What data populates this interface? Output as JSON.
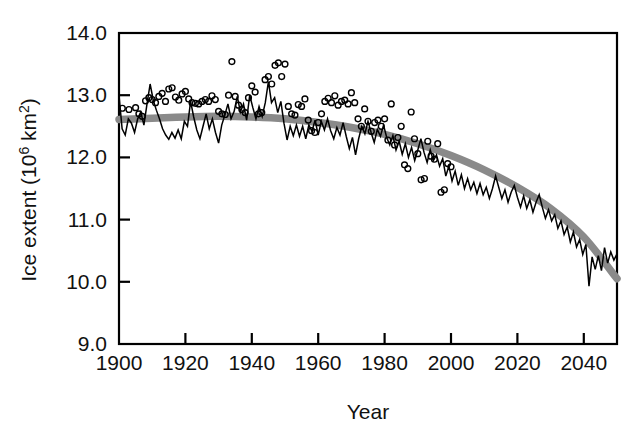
{
  "chart_data": {
    "type": "line",
    "title": "",
    "subtitle": "",
    "xlabel": "Year",
    "ylabel": "Ice extent (10^6 km^2)",
    "ylabel_parts": {
      "prefix": "Ice extent (10",
      "superscript": "6",
      "suffix_before_sup2": " km",
      "superscript2": "2",
      "close": ")"
    },
    "xlim": [
      1900,
      2050
    ],
    "ylim": [
      9.0,
      14.0
    ],
    "xticks": [
      1900,
      1920,
      1940,
      1960,
      1980,
      2000,
      2020,
      2040
    ],
    "xtick_labels": [
      "1900",
      "1920",
      "1940",
      "1960",
      "1980",
      "2000",
      "2020",
      "2040"
    ],
    "yticks": [
      9.0,
      10.0,
      11.0,
      12.0,
      13.0,
      14.0
    ],
    "ytick_labels": [
      "9.0",
      "10.0",
      "11.0",
      "12.0",
      "13.0",
      "14.0"
    ],
    "grid": false,
    "legend_position": "none",
    "colors": {
      "model_line": "#000000",
      "trend_line": "#8a8a8a",
      "observation_marker_stroke": "#000000",
      "frame": "#000000",
      "background": "#ffffff"
    },
    "series": [
      {
        "name": "Modelled annual ice extent",
        "type": "line",
        "style": "thin solid black jagged line",
        "x_start": 1900,
        "x_end": 2050,
        "values": [
          13.0,
          12.46,
          12.36,
          12.62,
          12.55,
          12.4,
          12.62,
          12.73,
          12.52,
          12.86,
          13.18,
          12.92,
          12.76,
          12.62,
          12.46,
          12.36,
          12.29,
          12.4,
          12.31,
          12.44,
          12.3,
          12.58,
          12.5,
          12.9,
          12.65,
          12.44,
          12.3,
          12.5,
          12.7,
          12.46,
          12.62,
          12.4,
          12.23,
          12.52,
          12.68,
          12.86,
          12.62,
          12.74,
          12.98,
          12.73,
          12.86,
          12.6,
          13.0,
          12.8,
          12.62,
          12.82,
          12.66,
          12.88,
          13.22,
          12.88,
          12.96,
          12.72,
          12.9,
          12.55,
          12.28,
          12.5,
          12.35,
          12.52,
          12.34,
          12.5,
          12.3,
          12.52,
          12.42,
          12.6,
          12.36,
          12.58,
          12.44,
          12.62,
          12.43,
          12.3,
          12.48,
          12.36,
          12.56,
          12.34,
          12.14,
          12.32,
          12.04,
          12.3,
          12.5,
          12.38,
          12.58,
          12.4,
          12.24,
          12.45,
          12.34,
          12.52,
          12.32,
          12.2,
          12.35,
          12.12,
          12.26,
          12.05,
          12.22,
          12.0,
          12.16,
          11.95,
          12.12,
          12.3,
          12.08,
          11.92,
          12.12,
          11.95,
          12.04,
          11.86,
          11.98,
          11.7,
          11.86,
          11.62,
          11.78,
          11.55,
          11.72,
          11.5,
          11.66,
          11.48,
          11.6,
          11.42,
          11.58,
          11.4,
          11.52,
          11.34,
          11.5,
          11.7,
          11.52,
          11.34,
          11.48,
          11.28,
          11.44,
          11.55,
          11.36,
          11.2,
          11.38,
          11.18,
          11.32,
          11.12,
          11.28,
          11.4,
          11.2,
          11.02,
          11.16,
          10.98,
          11.08,
          10.86,
          10.98,
          10.76,
          10.88,
          10.64,
          10.8,
          10.56,
          10.68,
          10.44,
          10.6,
          9.93,
          10.4,
          10.2,
          10.42,
          10.18,
          10.55,
          10.3,
          10.48,
          10.35,
          10.45
        ]
      },
      {
        "name": "Smoothed trend (fit)",
        "type": "line",
        "style": "thick gray smooth curve",
        "x": [
          1900,
          1910,
          1920,
          1930,
          1940,
          1950,
          1960,
          1970,
          1980,
          1990,
          2000,
          2010,
          2020,
          2030,
          2040,
          2050
        ],
        "values": [
          12.61,
          12.63,
          12.65,
          12.66,
          12.65,
          12.62,
          12.56,
          12.48,
          12.37,
          12.22,
          12.03,
          11.8,
          11.52,
          11.18,
          10.72,
          10.05
        ]
      },
      {
        "name": "Observations",
        "type": "scatter",
        "style": "small open circles",
        "points": [
          [
            1901,
            12.79
          ],
          [
            1903,
            12.77
          ],
          [
            1905,
            12.8
          ],
          [
            1906,
            12.7
          ],
          [
            1907,
            12.66
          ],
          [
            1908,
            12.91
          ],
          [
            1909,
            12.96
          ],
          [
            1910,
            12.93
          ],
          [
            1911,
            12.88
          ],
          [
            1912,
            12.98
          ],
          [
            1913,
            13.03
          ],
          [
            1914,
            12.9
          ],
          [
            1915,
            13.1
          ],
          [
            1916,
            13.12
          ],
          [
            1917,
            12.97
          ],
          [
            1918,
            12.92
          ],
          [
            1919,
            13.02
          ],
          [
            1920,
            13.06
          ],
          [
            1921,
            12.94
          ],
          [
            1922,
            12.88
          ],
          [
            1923,
            12.87
          ],
          [
            1924,
            12.86
          ],
          [
            1925,
            12.9
          ],
          [
            1926,
            12.93
          ],
          [
            1927,
            12.9
          ],
          [
            1928,
            12.99
          ],
          [
            1929,
            12.93
          ],
          [
            1930,
            12.74
          ],
          [
            1931,
            12.7
          ],
          [
            1932,
            12.69
          ],
          [
            1933,
            13.0
          ],
          [
            1934,
            13.54
          ],
          [
            1935,
            12.98
          ],
          [
            1936,
            12.84
          ],
          [
            1937,
            12.77
          ],
          [
            1938,
            12.72
          ],
          [
            1939,
            12.96
          ],
          [
            1940,
            13.15
          ],
          [
            1941,
            13.05
          ],
          [
            1942,
            12.7
          ],
          [
            1943,
            12.72
          ],
          [
            1944,
            13.25
          ],
          [
            1945,
            13.3
          ],
          [
            1946,
            13.18
          ],
          [
            1947,
            13.48
          ],
          [
            1948,
            13.52
          ],
          [
            1949,
            13.3
          ],
          [
            1950,
            13.5
          ],
          [
            1951,
            12.82
          ],
          [
            1952,
            12.7
          ],
          [
            1953,
            12.68
          ],
          [
            1954,
            12.85
          ],
          [
            1955,
            12.82
          ],
          [
            1956,
            12.94
          ],
          [
            1957,
            12.6
          ],
          [
            1958,
            12.43
          ],
          [
            1959,
            12.4
          ],
          [
            1960,
            12.56
          ],
          [
            1961,
            12.7
          ],
          [
            1962,
            12.9
          ],
          [
            1963,
            12.95
          ],
          [
            1964,
            12.88
          ],
          [
            1965,
            12.99
          ],
          [
            1966,
            12.84
          ],
          [
            1967,
            12.9
          ],
          [
            1968,
            12.92
          ],
          [
            1969,
            12.86
          ],
          [
            1970,
            13.04
          ],
          [
            1971,
            12.88
          ],
          [
            1972,
            12.62
          ],
          [
            1973,
            12.5
          ],
          [
            1974,
            12.78
          ],
          [
            1975,
            12.58
          ],
          [
            1976,
            12.42
          ],
          [
            1977,
            12.56
          ],
          [
            1978,
            12.6
          ],
          [
            1979,
            12.5
          ],
          [
            1980,
            12.62
          ],
          [
            1981,
            12.28
          ],
          [
            1982,
            12.86
          ],
          [
            1983,
            12.2
          ],
          [
            1984,
            12.32
          ],
          [
            1985,
            12.5
          ],
          [
            1986,
            11.88
          ],
          [
            1987,
            11.82
          ],
          [
            1988,
            12.73
          ],
          [
            1989,
            12.3
          ],
          [
            1990,
            12.06
          ],
          [
            1991,
            11.64
          ],
          [
            1992,
            11.66
          ],
          [
            1993,
            12.26
          ],
          [
            1994,
            12.02
          ],
          [
            1995,
            11.97
          ],
          [
            1996,
            12.22
          ],
          [
            1997,
            11.44
          ],
          [
            1998,
            11.48
          ],
          [
            1999,
            11.9
          ],
          [
            2000,
            11.85
          ]
        ]
      }
    ],
    "annotations": []
  },
  "figure": {
    "frame_visible": true,
    "tick_direction": "in"
  }
}
